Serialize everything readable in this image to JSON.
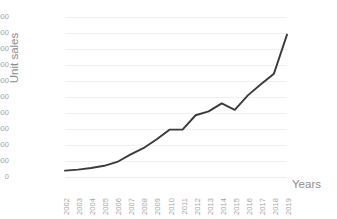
{
  "chart_data": {
    "type": "line",
    "title": "Unit sales from 2002 to 2019",
    "xlabel": "Years",
    "ylabel": "Unit sales",
    "categories": [
      "2002",
      "2003",
      "2004",
      "2005",
      "2006",
      "2007",
      "2008",
      "2009",
      "2010",
      "2011",
      "2012",
      "2013",
      "2014",
      "2015",
      "2016",
      "2017",
      "2018",
      "2019"
    ],
    "values": [
      2000,
      2300,
      2800,
      3500,
      4700,
      7000,
      9000,
      11700,
      14800,
      14800,
      19300,
      20500,
      23000,
      21000,
      25500,
      29000,
      32300,
      44500
    ],
    "series": [
      {
        "name": "Unit sales",
        "values": [
          2000,
          2300,
          2800,
          3500,
          4700,
          7000,
          9000,
          11700,
          14800,
          14800,
          19300,
          20500,
          23000,
          21000,
          25500,
          29000,
          32300,
          44500
        ],
        "color": "#3b3b3b"
      }
    ],
    "ylim": [
      0,
      50000
    ],
    "ytick_values": [
      0,
      5000,
      10000,
      15000,
      20000,
      25000,
      30000,
      35000,
      40000,
      45000,
      50000
    ],
    "ytick_labels": [
      "0",
      "5 000",
      "10 000",
      "15 000",
      "20 000",
      "25 000",
      "30 000",
      "35 000",
      "40 000",
      "45 000",
      "50 000"
    ],
    "grid": true,
    "grid_color": "#f0f0f1",
    "legend": false,
    "legend_position": "none",
    "background": "#ffffff",
    "xtick_rotation": -90,
    "annotations": []
  }
}
